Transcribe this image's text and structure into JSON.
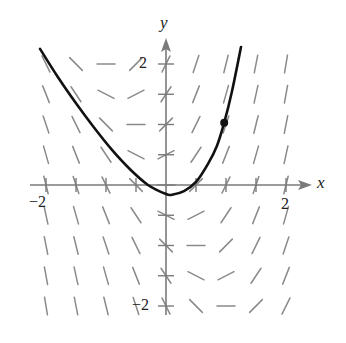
{
  "chart_data": {
    "type": "slope_field",
    "title": "",
    "xlabel": "x",
    "ylabel": "y",
    "xlim": [
      -2.1,
      2.3
    ],
    "ylim": [
      -2.3,
      2.5
    ],
    "grid": false,
    "x_ticks": [
      -2,
      -1.5,
      -1,
      -0.5,
      0.5,
      1,
      1.5,
      2
    ],
    "y_ticks": [
      -2,
      -1.5,
      -1,
      -0.5,
      0.5,
      1,
      1.5,
      2
    ],
    "x_tick_labels": [
      {
        "value": -2,
        "label": "−2"
      },
      {
        "value": 2,
        "label": "2"
      }
    ],
    "y_tick_labels": [
      {
        "value": 2,
        "label": "2"
      },
      {
        "value": -2,
        "label": "−2"
      }
    ],
    "differential_equation": "dy/dx = 2x + y",
    "field_grid": {
      "x": [
        -2,
        -1.5,
        -1,
        -0.5,
        0,
        0.5,
        1,
        1.5,
        2
      ],
      "y": [
        2,
        1.5,
        1,
        0.5,
        0,
        -0.5,
        -1,
        -1.5,
        -2
      ],
      "slopes_note": "slope at (x,y) = 2x + y"
    },
    "solution_curve": {
      "points": [
        [
          -2.1,
          2.25
        ],
        [
          -1.8,
          1.78
        ],
        [
          -1.5,
          1.35
        ],
        [
          -1.2,
          0.95
        ],
        [
          -0.9,
          0.58
        ],
        [
          -0.6,
          0.26
        ],
        [
          -0.3,
          0.0
        ],
        [
          0.0,
          -0.15
        ],
        [
          0.1,
          -0.16
        ],
        [
          0.3,
          -0.1
        ],
        [
          0.5,
          0.05
        ],
        [
          0.7,
          0.35
        ],
        [
          0.85,
          0.65
        ],
        [
          0.97,
          1.03
        ],
        [
          1.1,
          1.55
        ],
        [
          1.25,
          2.28
        ]
      ],
      "initial_point": [
        0.97,
        1.03
      ]
    }
  },
  "labels": {
    "x_axis": "x",
    "y_axis": "y",
    "x_neg2": "−2",
    "x_pos2": "2",
    "y_pos2": "2",
    "y_neg2": "−2"
  },
  "colors": {
    "axis": "#7a7a7a",
    "field": "#8a8a8a",
    "curve": "#111111",
    "text": "#222222"
  }
}
